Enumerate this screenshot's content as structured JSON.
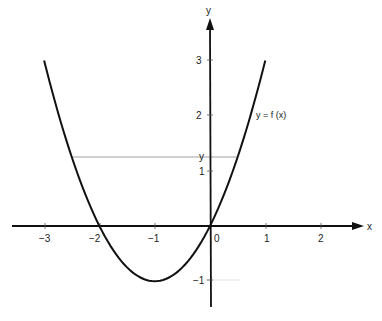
{
  "chart_data": {
    "type": "line",
    "title": "",
    "xlabel": "x",
    "ylabel": "y",
    "xlim": [
      -3.5,
      2.8
    ],
    "ylim": [
      -1.5,
      3.7
    ],
    "grid": false,
    "x_ticks": [
      "-3",
      "-2",
      "-1",
      "0",
      "1",
      "2"
    ],
    "y_ticks": [
      "3",
      "2",
      "1",
      "-1"
    ],
    "series": [
      {
        "name": "y = f (x)",
        "function": "x^2 + 2x",
        "x": [
          -3,
          -2.5,
          -2,
          -1.5,
          -1,
          -0.5,
          0,
          0.5,
          1
        ],
        "y": [
          3,
          1.25,
          0,
          -0.75,
          -1,
          -0.75,
          0,
          1.25,
          3
        ]
      }
    ],
    "annotations": [
      {
        "text": "y = f (x)",
        "position": "right of curve near y=2"
      },
      {
        "text": "y",
        "type": "horizontal reference line",
        "value": 1.25,
        "x_range": [
          -2.5,
          0.5
        ]
      }
    ]
  },
  "labels": {
    "x_axis": "x",
    "y_axis": "y",
    "curve": "y = f (x)",
    "hline": "y",
    "xt": {
      "m3": "−3",
      "m2": "−2",
      "m1": "−1",
      "z": "0",
      "p1": "1",
      "p2": "2"
    },
    "yt": {
      "p3": "3",
      "p2": "2",
      "p1": "1",
      "m1": "−1"
    }
  }
}
